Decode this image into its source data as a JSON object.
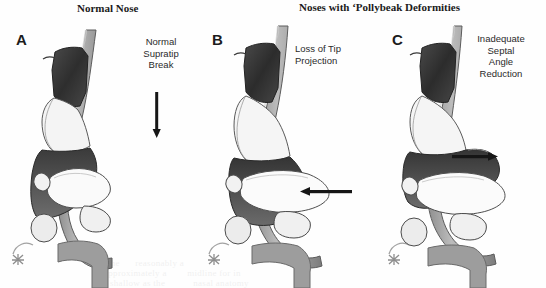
{
  "figure": {
    "background_color": "#fefefe",
    "ink_color": "#1b1b1b",
    "type": "medical-anatomical-illustration",
    "view": "lateral sagittal nasal profile"
  },
  "titles": {
    "normal": "Normal Nose",
    "pollybeak": "Noses with ‘Pollybeak Deformities"
  },
  "panels": [
    {
      "letter": "A",
      "condition": "Normal Nose",
      "callout": "Normal\nSupratip\nBreak",
      "arrow": {
        "name": "supratip-break-pointer",
        "direction": "down"
      },
      "signature": "artist-monogram"
    },
    {
      "letter": "B",
      "condition": "Pollybeak Deformity",
      "callout": "Loss of Tip\nProjection",
      "arrow": {
        "name": "tip-projection-pointer",
        "direction": "left"
      },
      "signature": "artist-monogram"
    },
    {
      "letter": "C",
      "condition": "Pollybeak Deformity",
      "callout": "Inadequate\nSeptal\nAngle\nReduction",
      "arrow": {
        "name": "septal-angle-pointer",
        "direction": "right"
      },
      "signature": "artist-monogram"
    }
  ],
  "anatomy_labels": [
    "nasal-bone",
    "upper-lateral-cartilage",
    "septal-cartilage",
    "lower-lateral-cartilage",
    "soft-tissue-envelope",
    "columella",
    "nostril",
    "upper-lip"
  ],
  "scan_artifacts": {
    "bleed_through_line_1": "the      reasonably a",
    "bleed_through_line_2": "approximately a        midline for in",
    "bleed_through_line_3": "shallow as the           nasal anatomy"
  }
}
